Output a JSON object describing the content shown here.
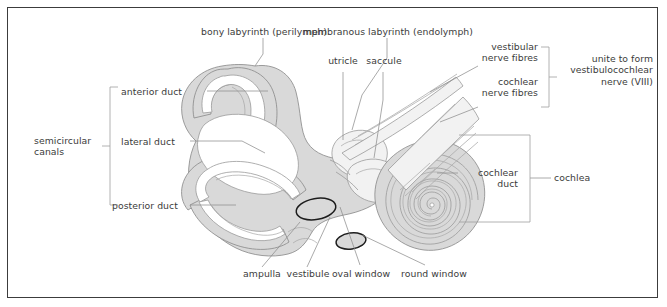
{
  "figure": {
    "frame_color": "#3c3c3c",
    "background_color": "#ffffff",
    "text_color": "#3b3b3b",
    "leader_line_color": "#8c8c8c",
    "bracket_color": "#9a9a9a",
    "structure_outline_color": "#8a8a8a",
    "structure_fill_color": "#d9d9d9",
    "lumen_fill_color": "#ffffff",
    "window_outline_color": "#1c1c1c"
  },
  "labels": {
    "bony_labyrinth": "bony labyrinth (perilymph)",
    "membranous_labyrinth": "membranous labyrinth (endolymph)",
    "utricle": "utricle",
    "saccule": "saccule",
    "vestibular_nerve_fibres": "vestibular\nnerve fibres",
    "cochlear_nerve_fibres": "cochlear\nnerve fibres",
    "unite_to_form": "unite to form\nvestibulocochlear\nnerve (VIII)",
    "anterior_duct": "anterior duct",
    "lateral_duct": "lateral duct",
    "posterior_duct": "posterior duct",
    "semicircular_canals": "semicircular\ncanals",
    "cochlear_duct": "cochlear\nduct",
    "cochlea": "cochlea",
    "ampulla": "ampulla",
    "vestibule": "vestibule",
    "oval_window": "oval window",
    "round_window": "round window"
  }
}
